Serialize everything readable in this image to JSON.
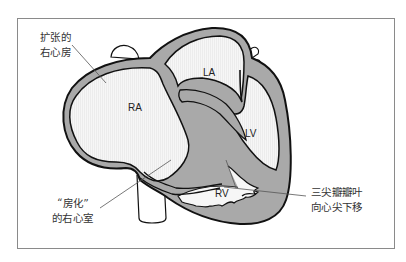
{
  "figure": {
    "type": "anatomical-diagram"
  },
  "chambers": {
    "ra": "RA",
    "la": "LA",
    "lv": "LV",
    "rv": "RV"
  },
  "annotations": {
    "dilated_ra": {
      "line1": "扩张的",
      "line2": "右心房"
    },
    "atrialized_rv": {
      "line1": "“房化”",
      "line2": "的右心室"
    },
    "tricuspid_displaced": {
      "line1": "三尖瓣瓣叶",
      "line2": "向心尖下移"
    }
  },
  "colors": {
    "wall_fill": "#a9a9a9",
    "wall_stroke": "#111111",
    "chamber_fill": "#f4f4f4",
    "leader_line": "#555555",
    "frame_border": "#8a8a8a"
  }
}
